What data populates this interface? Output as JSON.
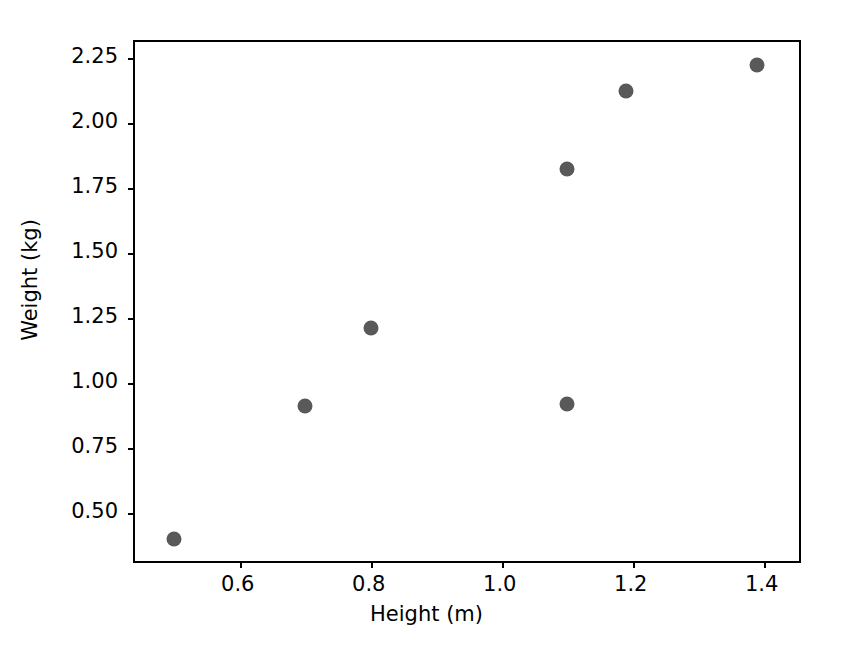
{
  "chart_data": {
    "type": "scatter",
    "title": "",
    "xlabel": "Height (m)",
    "ylabel": "Weight (kg)",
    "xlim": [
      0.44,
      1.46
    ],
    "ylim": [
      0.3,
      2.31
    ],
    "xticks": [
      0.6,
      0.8,
      1.0,
      1.2,
      1.4
    ],
    "xtick_labels": [
      "0.6",
      "0.8",
      "1.0",
      "1.2",
      "1.4"
    ],
    "yticks": [
      0.5,
      0.75,
      1.0,
      1.25,
      1.5,
      1.75,
      2.0,
      2.25
    ],
    "ytick_labels": [
      "0.50",
      "0.75",
      "1.00",
      "1.25",
      "1.50",
      "1.75",
      "2.00",
      "2.25"
    ],
    "grid": false,
    "legend": null,
    "marker_color": "#595959",
    "marker_size": 15,
    "axes_color": "#000000",
    "background_color": "#ffffff",
    "x": [
      0.5,
      0.7,
      0.8,
      1.1,
      1.1,
      1.19,
      1.39
    ],
    "y": [
      0.4,
      0.91,
      1.21,
      0.92,
      1.82,
      2.12,
      2.22
    ],
    "points": [
      {
        "x": 0.5,
        "y": 0.4
      },
      {
        "x": 0.7,
        "y": 0.91
      },
      {
        "x": 0.8,
        "y": 1.21
      },
      {
        "x": 1.1,
        "y": 0.92
      },
      {
        "x": 1.1,
        "y": 1.82
      },
      {
        "x": 1.19,
        "y": 2.12
      },
      {
        "x": 1.39,
        "y": 2.22
      }
    ]
  }
}
